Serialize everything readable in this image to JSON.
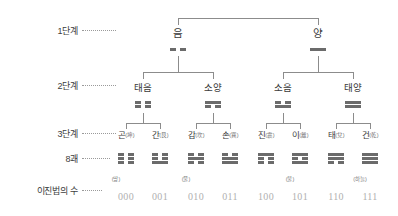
{
  "row_labels": [
    {
      "id": "stage1",
      "text": "1단계"
    },
    {
      "id": "stage2",
      "text": "2단계"
    },
    {
      "id": "stage3",
      "text": "3단계"
    },
    {
      "id": "gua8",
      "text": "8괘"
    },
    {
      "id": "binary",
      "text": "이진법의 수"
    }
  ],
  "level1": [
    {
      "id": "eum",
      "label": "음",
      "lines": [
        "broken"
      ]
    },
    {
      "id": "yang",
      "label": "양",
      "lines": [
        "solid"
      ]
    }
  ],
  "level2": [
    {
      "id": "taeeum",
      "label": "태음",
      "lines": [
        "broken",
        "broken"
      ]
    },
    {
      "id": "soyang",
      "label": "소양",
      "lines": [
        "broken",
        "solid"
      ]
    },
    {
      "id": "soeum",
      "label": "소음",
      "lines": [
        "solid",
        "broken"
      ]
    },
    {
      "id": "taeyang",
      "label": "태양",
      "lines": [
        "solid",
        "solid"
      ]
    }
  ],
  "level3": [
    {
      "id": "gon",
      "label": "곤",
      "hanja": "(坤)",
      "element": "(땅)",
      "binary": "000",
      "lines": [
        "broken",
        "broken",
        "broken"
      ]
    },
    {
      "id": "gan",
      "label": "간",
      "hanja": "(艮)",
      "element": "",
      "binary": "001",
      "lines": [
        "solid",
        "broken",
        "broken"
      ]
    },
    {
      "id": "gam",
      "label": "감",
      "hanja": "(坎)",
      "element": "(물)",
      "binary": "010",
      "lines": [
        "broken",
        "solid",
        "broken"
      ]
    },
    {
      "id": "son",
      "label": "손",
      "hanja": "(巽)",
      "element": "",
      "binary": "011",
      "lines": [
        "solid",
        "solid",
        "broken"
      ]
    },
    {
      "id": "jin",
      "label": "진",
      "hanja": "(震)",
      "element": "",
      "binary": "100",
      "lines": [
        "broken",
        "broken",
        "solid"
      ]
    },
    {
      "id": "i",
      "label": "이",
      "hanja": "(離)",
      "element": "(불)",
      "binary": "101",
      "lines": [
        "solid",
        "broken",
        "solid"
      ]
    },
    {
      "id": "tae",
      "label": "태",
      "hanja": "(兌)",
      "element": "",
      "binary": "110",
      "lines": [
        "broken",
        "solid",
        "solid"
      ]
    },
    {
      "id": "geon",
      "label": "건",
      "hanja": "(乾)",
      "element": "(하늘)",
      "binary": "111",
      "lines": [
        "solid",
        "solid",
        "solid"
      ]
    }
  ],
  "colors": {
    "line": "#8c8c8c",
    "gua": "#6b6b6b",
    "text": "#3a3a3a",
    "binary": "#b0b0b0",
    "dots": "#9a9a9a"
  }
}
